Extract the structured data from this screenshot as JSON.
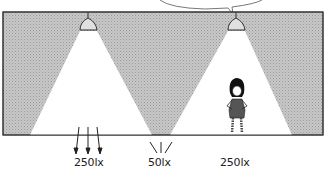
{
  "diagram": {
    "type": "illumination-comparison",
    "colors": {
      "background_shade": "#bdbdbd",
      "light_cone": "#ffffff",
      "outline": "#333333"
    },
    "lamps": [
      {
        "id": "left-lamp",
        "x": 88
      },
      {
        "id": "right-lamp",
        "x": 236
      }
    ],
    "labels": [
      {
        "id": "left-illuminance",
        "text": "250lx"
      },
      {
        "id": "middle-illuminance",
        "text": "50lx"
      },
      {
        "id": "right-illuminance",
        "text": "250lx"
      }
    ],
    "speech_bubble": {
      "text": ""
    }
  }
}
